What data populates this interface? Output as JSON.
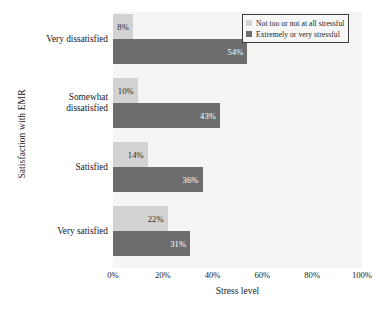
{
  "chart_data": {
    "type": "bar",
    "orientation": "horizontal",
    "title": "",
    "xlabel": "Stress level",
    "ylabel": "Satisfaction with EMR",
    "categories": [
      "Very dissatisfied",
      "Somewhat dissatisfied",
      "Satisfied",
      "Very satisfied"
    ],
    "series": [
      {
        "name": "Not too or not at all stressful",
        "color": "#d2d2d2",
        "values": [
          8,
          10,
          14,
          22
        ],
        "value_labels": [
          "8%",
          "10%",
          "14%",
          "22%"
        ]
      },
      {
        "name": "Extremely or very stressful",
        "color": "#6d6d6d",
        "values": [
          54,
          43,
          36,
          31
        ],
        "value_labels": [
          "54%",
          "43%",
          "36%",
          "31%"
        ]
      }
    ],
    "xlim": [
      0,
      100
    ],
    "xticks": [
      0,
      20,
      40,
      60,
      80,
      100
    ],
    "xtick_labels": [
      "0%",
      "20%",
      "40%",
      "60%",
      "80%",
      "100%"
    ],
    "grid": false,
    "legend_position": "top-right",
    "plot_background": "#f5f5f5",
    "figure_background": "#ffffff"
  },
  "category_label_lines": [
    [
      "Very dissatisfied"
    ],
    [
      "Somewhat",
      "dissatisfied"
    ],
    [
      "Satisfied"
    ],
    [
      "Very satisfied"
    ]
  ],
  "legend": {
    "entries": [
      {
        "label": "Not too or not at all stressful",
        "swatch": "light-gray-square-icon"
      },
      {
        "label": "Extremely or very stressful",
        "swatch": "dark-gray-square-icon"
      }
    ]
  }
}
